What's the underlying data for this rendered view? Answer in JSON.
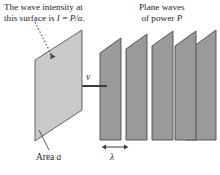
{
  "figure": {
    "title_role": "physics-diagram-plane-waves-intensity",
    "captions": {
      "intensity_line1": "The wave intensity at",
      "intensity_line2_prefix": "this surface is ",
      "intensity_symbol_I": "I",
      "intensity_equals": " = ",
      "intensity_expr": "P/a",
      "intensity_period": ".",
      "planewaves_line1": "Plane waves",
      "planewaves_line2_prefix": "of power ",
      "planewaves_symbol_P": "P"
    },
    "labels": {
      "area_prefix": "Area ",
      "area_symbol": "a",
      "velocity_symbol": "v",
      "wavelength_symbol": "λ"
    },
    "colors": {
      "surface_fill": "#c9c9c9",
      "surface_stroke": "#555555",
      "wave_fill": "#9a9a9a",
      "wave_stroke": "#4a4a4a",
      "arrow": "#3b3b3b",
      "leader_line": "#4a4a4a",
      "text": "#262626",
      "background": "#ffffff"
    },
    "geometry": {
      "surface_plane": {
        "description": "absorbing surface of area a, parallelogram in perspective",
        "points": "82,30 82,110 35,141 35,60"
      },
      "wave_planes_count": 5,
      "wave_planes": [
        {
          "index": 1,
          "points": "121,38 121,140 100,140 100,53"
        },
        {
          "index": 2,
          "points": "147,34 147,140 126,140 126,49"
        },
        {
          "index": 3,
          "points": "173,31 173,140 152,140 152,46"
        },
        {
          "index": 4,
          "points": "196,31 196,140 175,140 175,46"
        },
        {
          "index": 5,
          "points": "216,30 216,140 186,140 186,52"
        }
      ],
      "velocity_arrow": {
        "from_x": 106,
        "from_y": 86,
        "to_x": 47,
        "to_y": 86
      },
      "velocity_stem": {
        "x1": 106,
        "y1": 86,
        "x2": 106,
        "y2": 86
      },
      "pointer_dotted": {
        "from_x": 36,
        "from_y": 22,
        "to_x": 54,
        "to_y": 60
      },
      "area_leader": {
        "from_x": 48,
        "from_y": 150,
        "to_x": 40,
        "to_y": 131
      },
      "lambda_arrow": {
        "x1": 104,
        "y1": 148,
        "x2": 124,
        "y2": 148
      }
    }
  }
}
